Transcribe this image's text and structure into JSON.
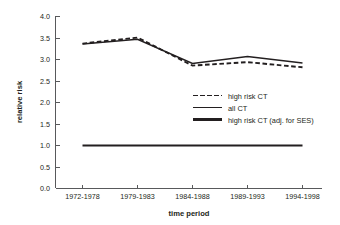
{
  "chart_data": {
    "type": "line",
    "title": "",
    "subtitle": "",
    "xlabel": "time period",
    "ylabel": "relative risk",
    "categories": [
      "1972-1978",
      "1979-1983",
      "1984-1988",
      "1989-1993",
      "1994-1998"
    ],
    "ylim": [
      0.0,
      4.0
    ],
    "ytick_labels": [
      "0.0",
      "0.5",
      "1.0",
      "1.5",
      "2.0",
      "2.5",
      "3.0",
      "3.5",
      "4.0"
    ],
    "ytick_values": [
      0.0,
      0.5,
      1.0,
      1.5,
      2.0,
      2.5,
      3.0,
      3.5,
      4.0
    ],
    "grid": false,
    "legend_position": "center-right",
    "series": [
      {
        "name": "high risk CT",
        "style": "dashed",
        "color": "#231f20",
        "values": [
          3.36,
          3.5,
          2.85,
          2.93,
          2.81
        ]
      },
      {
        "name": "all CT",
        "style": "solid",
        "color": "#231f20",
        "values": [
          3.35,
          3.46,
          2.9,
          3.06,
          2.91
        ]
      },
      {
        "name": "high risk CT (adj. for SES)",
        "style": "solid-thick",
        "color": "#231f20",
        "values": [
          1.0,
          1.0,
          1.0,
          1.0,
          1.0
        ]
      }
    ]
  },
  "legend": {
    "items": [
      {
        "label": "high risk CT",
        "style": "dashed"
      },
      {
        "label": "all CT",
        "style": "solid"
      },
      {
        "label": "high risk CT (adj. for SES)",
        "style": "solid-thick"
      }
    ]
  },
  "axes": {
    "y_title": "relative risk",
    "x_title": "time period",
    "y_ticks": [
      "4.0",
      "3.5",
      "3.0",
      "2.5",
      "2.0",
      "1.5",
      "1.0",
      "0.5",
      "0.0"
    ],
    "x_ticks": [
      "1972-1978",
      "1979-1983",
      "1984-1988",
      "1989-1993",
      "1994-1998"
    ]
  },
  "colors": {
    "line": "#231f20",
    "axis": "#58595b",
    "background": "#ffffff"
  }
}
